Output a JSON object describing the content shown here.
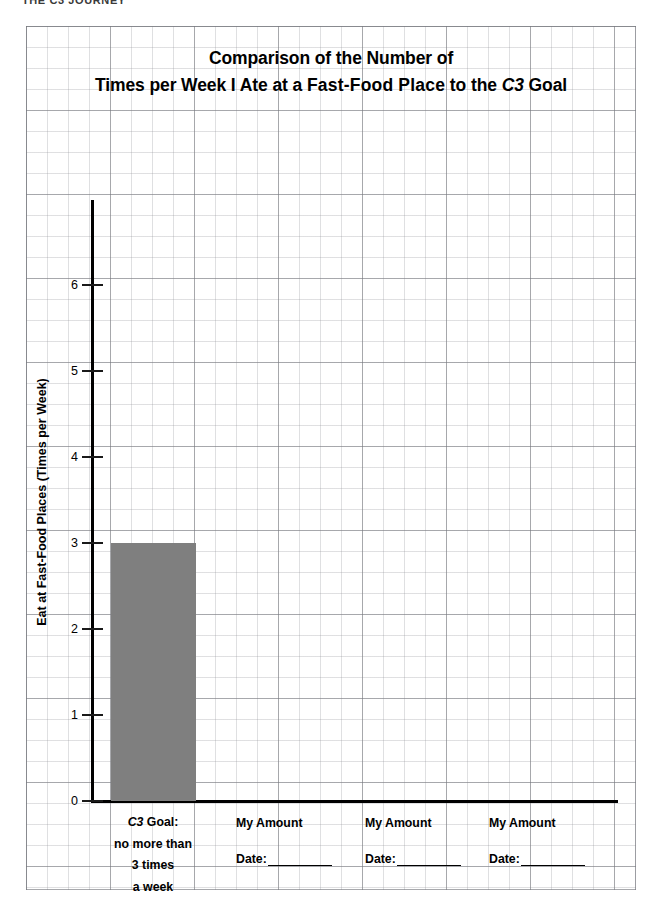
{
  "page": {
    "top_fragment": "THE C3 JOURNEY"
  },
  "chart_data": {
    "type": "bar",
    "title_line1": "Comparison of the Number of",
    "title_line2_part1": "Times per Week I Ate at a ",
    "title_line2_bold": "Fast-Food Place",
    "title_line2_part2": " to the ",
    "title_line2_italic": "C3",
    "title_line2_part3": " Goal",
    "title": "Comparison of the Number of Times per Week I Ate at a Fast-Food Place to the C3 Goal",
    "xlabel": "",
    "ylabel": "Eat at Fast-Food Places (Times per Week)",
    "ylim": [
      0,
      6.9
    ],
    "yticks": [
      0,
      1,
      2,
      3,
      4,
      5,
      6
    ],
    "ytick_labels": [
      "0",
      "1",
      "2",
      "3",
      "4",
      "5",
      "6"
    ],
    "grid": true,
    "legend": "none",
    "bar_color": "#7f7f7f",
    "categories": [
      "C3 Goal: no more than 3 times a week",
      "My Amount",
      "My Amount",
      "My Amount"
    ],
    "values": [
      3,
      null,
      null,
      null
    ]
  },
  "axis": {
    "goal_label": {
      "line1_italic": "C3",
      "line1_rest": " Goal:",
      "line2": "no more than",
      "line3": "3 times",
      "line4": "a week"
    },
    "amount_columns": [
      {
        "title": "My Amount",
        "date_label": "Date:"
      },
      {
        "title": "My Amount",
        "date_label": "Date:"
      },
      {
        "title": "My Amount",
        "date_label": "Date:"
      }
    ]
  }
}
